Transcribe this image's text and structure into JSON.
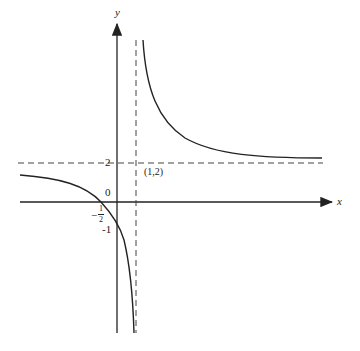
{
  "figure": {
    "type": "function-graph",
    "function": "y = (2x+1)/(x-1)",
    "axes": {
      "x_label": "x",
      "y_label": "y",
      "origin_label": "0"
    },
    "asymptotes": {
      "vertical": "x = 1",
      "horizontal": "y = 2"
    },
    "labels": {
      "y_tick_2": "2",
      "point_label": "(1,2)",
      "y_tick_neg1": "-1",
      "x_intercept_sign": "−",
      "x_intercept_num": "1",
      "x_intercept_den": "2"
    },
    "colors": {
      "curve": "#222222",
      "axes": "#222222",
      "asymptote": "#444444",
      "background": "#ffffff"
    }
  }
}
